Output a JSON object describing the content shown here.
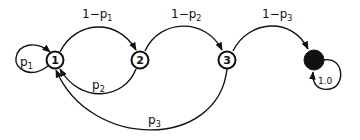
{
  "diagram": {
    "type": "markov-chain",
    "nodes": [
      {
        "id": "1",
        "label": "1",
        "filled": false
      },
      {
        "id": "2",
        "label": "2",
        "filled": false
      },
      {
        "id": "3",
        "label": "3",
        "filled": false
      },
      {
        "id": "absorbing",
        "label": "",
        "filled": true
      }
    ],
    "edges": [
      {
        "from": "1",
        "to": "1",
        "label_main": "p",
        "label_sub": "1"
      },
      {
        "from": "1",
        "to": "2",
        "label_main": "1−p",
        "label_sub": "1"
      },
      {
        "from": "2",
        "to": "1",
        "label_main": "p",
        "label_sub": "2"
      },
      {
        "from": "2",
        "to": "3",
        "label_main": "1−p",
        "label_sub": "2"
      },
      {
        "from": "3",
        "to": "absorbing",
        "label_main": "1−p",
        "label_sub": "3"
      },
      {
        "from": "3",
        "to": "1",
        "label_main": "p",
        "label_sub": "3"
      },
      {
        "from": "absorbing",
        "to": "absorbing",
        "label_main": "1.0",
        "label_sub": ""
      }
    ]
  }
}
